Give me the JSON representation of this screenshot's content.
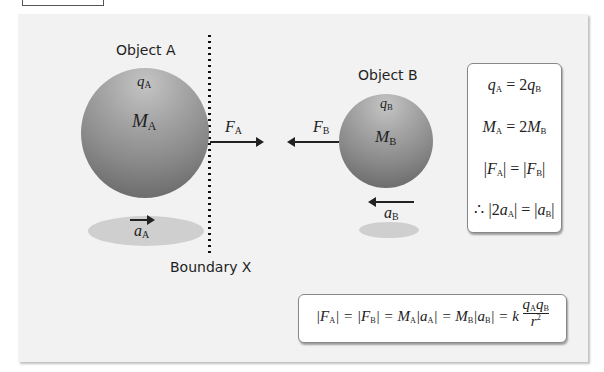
{
  "diagram": {
    "object_a": {
      "title": "Object A",
      "charge": {
        "symbol": "q",
        "sub": "A"
      },
      "mass": {
        "symbol": "M",
        "sub": "A"
      },
      "force": {
        "symbol": "F",
        "sub": "A",
        "direction": "right"
      },
      "acceleration": {
        "symbol": "a",
        "sub": "A",
        "direction": "right"
      }
    },
    "object_b": {
      "title": "Object B",
      "charge": {
        "symbol": "q",
        "sub": "B"
      },
      "mass": {
        "symbol": "M",
        "sub": "B"
      },
      "force": {
        "symbol": "F",
        "sub": "B",
        "direction": "left"
      },
      "acceleration": {
        "symbol": "a",
        "sub": "B",
        "direction": "left"
      }
    },
    "boundary_label": "Boundary X",
    "relations_box": {
      "lines": [
        {
          "left": "q",
          "left_sub": "A",
          "op": " = 2",
          "right": "q",
          "right_sub": "B"
        },
        {
          "left": "M",
          "left_sub": "A",
          "op": " = 2",
          "right": "M",
          "right_sub": "B"
        },
        {
          "pre": "|",
          "left": "F",
          "left_sub": "A",
          "op": "| = |",
          "right": "F",
          "right_sub": "B",
          "post": "|"
        },
        {
          "pre": "∴ |2",
          "left": "a",
          "left_sub": "A",
          "op": "| = |",
          "right": "a",
          "right_sub": "B",
          "post": "|"
        }
      ]
    },
    "main_equation": {
      "parts": [
        "|F",
        "A",
        "| = |F",
        "B",
        "| = M",
        "A",
        "|a",
        "A",
        "| = M",
        "B",
        "|a",
        "B",
        "| = k"
      ],
      "fraction": {
        "num": [
          "q",
          "A",
          "q",
          "B"
        ],
        "den": "r",
        "den_exp": "2"
      }
    },
    "colors": {
      "panel_bg": "#f2f2f2",
      "sphere_light": "#c4c4c4",
      "sphere_dark": "#606060",
      "shadow": "#cfcfcf",
      "ink": "#222222"
    }
  }
}
